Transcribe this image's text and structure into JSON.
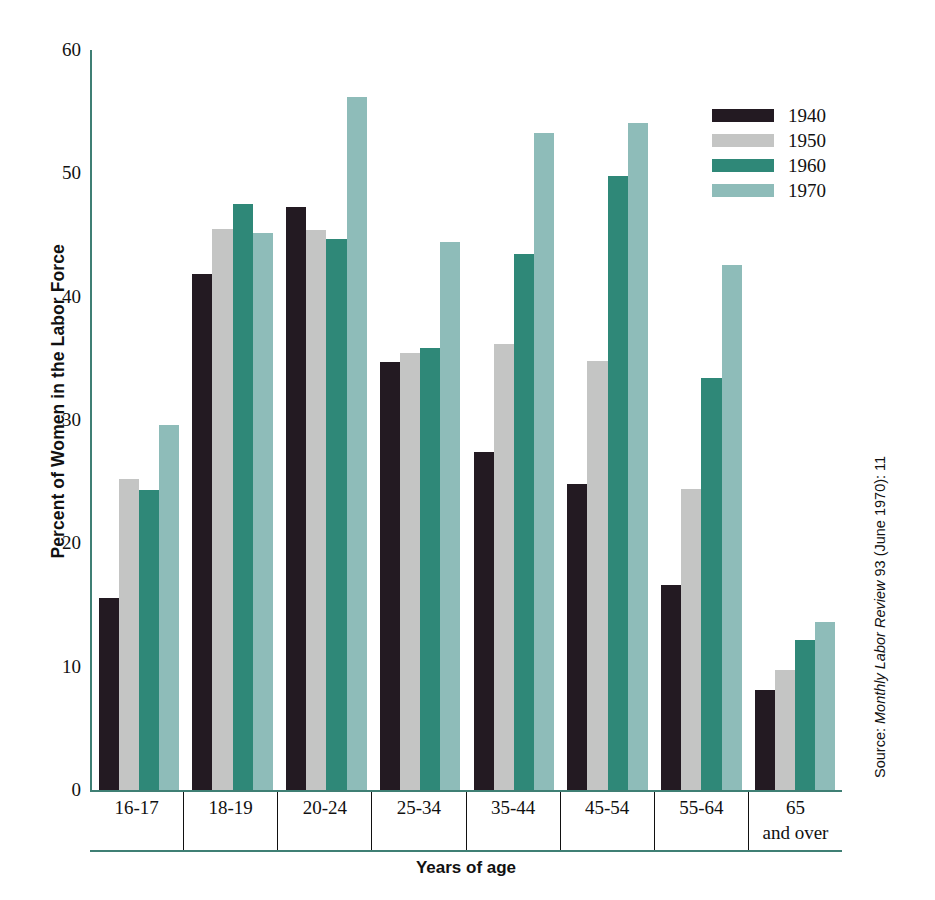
{
  "chart_data": {
    "type": "bar",
    "title": "",
    "xlabel": "Years of age",
    "ylabel": "Percent of Women in the Labor Force",
    "ylim": [
      0,
      60
    ],
    "yticks": [
      0,
      10,
      20,
      30,
      40,
      50,
      60
    ],
    "grid": false,
    "legend_position": "top-right",
    "categories": [
      "16-17",
      "18-19",
      "20-24",
      "25-34",
      "35-44",
      "45-54",
      "55-64",
      "65\nand over"
    ],
    "series": [
      {
        "name": "1940",
        "color": "#231a22",
        "values": [
          15.6,
          41.8,
          47.3,
          34.7,
          27.4,
          24.8,
          16.6,
          8.1
        ]
      },
      {
        "name": "1950",
        "color": "#c4c5c4",
        "values": [
          25.2,
          45.5,
          45.4,
          35.4,
          36.2,
          34.8,
          24.4,
          9.7
        ]
      },
      {
        "name": "1960",
        "color": "#2f8878",
        "values": [
          24.3,
          47.5,
          44.7,
          35.8,
          43.5,
          49.8,
          33.4,
          12.2
        ]
      },
      {
        "name": "1970",
        "color": "#8ebcb9",
        "values": [
          29.6,
          45.2,
          56.2,
          44.4,
          53.3,
          54.1,
          42.6,
          13.6
        ]
      }
    ],
    "source_prefix": "Source: ",
    "source_italic": "Monthly Labor Review",
    "source_suffix": " 93 (June 1970): 11",
    "axis_color": "#3f7f74"
  }
}
